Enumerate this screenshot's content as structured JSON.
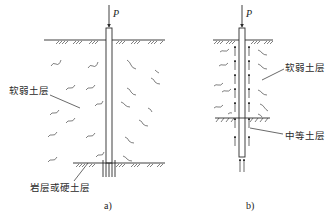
{
  "figure": {
    "panel_a": {
      "caption": "a)",
      "load_label": "P",
      "labels": {
        "soft_soil": "软弱土层",
        "rock_or_hard_soil": "岩层或硬土层"
      }
    },
    "panel_b": {
      "caption": "b)",
      "load_label": "P",
      "labels": {
        "soft_soil": "软弱土层",
        "medium_soil": "中等土层"
      }
    },
    "colors": {
      "line": "#2a2a2a",
      "background": "#ffffff"
    }
  }
}
